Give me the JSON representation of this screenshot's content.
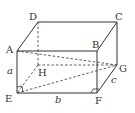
{
  "diagram": {
    "type": "cuboid",
    "vertices": {
      "A": {
        "label": "A",
        "x": 17,
        "y": 51
      },
      "B": {
        "label": "B",
        "x": 97,
        "y": 51
      },
      "C": {
        "label": "C",
        "x": 117,
        "y": 22
      },
      "D": {
        "label": "D",
        "x": 38,
        "y": 22
      },
      "E": {
        "label": "E",
        "x": 17,
        "y": 93
      },
      "F": {
        "label": "F",
        "x": 97,
        "y": 93
      },
      "G": {
        "label": "G",
        "x": 117,
        "y": 65
      },
      "H": {
        "label": "H",
        "x": 38,
        "y": 65
      }
    },
    "edge_labels": {
      "a": "a",
      "b": "b",
      "c": "c"
    },
    "solid_edges": [
      "A-B",
      "B-F",
      "F-E",
      "E-A",
      "A-D",
      "D-C",
      "C-B",
      "C-G",
      "G-F"
    ],
    "dashed_edges": [
      "D-H",
      "H-E",
      "H-G",
      "A-G",
      "E-G"
    ],
    "right_angles": [
      "E",
      "F"
    ],
    "colors": {
      "line": "#333333",
      "background": "#ffffff"
    }
  }
}
